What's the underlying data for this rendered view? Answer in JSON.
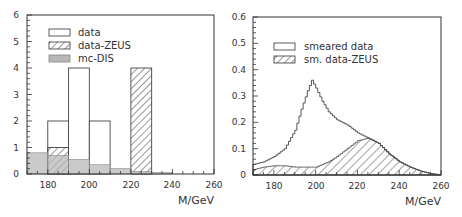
{
  "chart_data": [
    {
      "type": "bar",
      "subtype": "histogram",
      "title": "",
      "xlabel": "M/GeV",
      "ylabel": "",
      "xlim": [
        170,
        260
      ],
      "ylim": [
        0,
        6
      ],
      "xticks": [
        180,
        200,
        220,
        240,
        260
      ],
      "yticks": [
        0,
        1,
        2,
        3,
        4,
        5,
        6
      ],
      "grid": false,
      "legend_position": "upper-left",
      "bin_edges": [
        170,
        180,
        190,
        200,
        210,
        220,
        230,
        240,
        250,
        260
      ],
      "series": [
        {
          "name": "data",
          "style": "outline",
          "values": [
            0,
            2,
            4,
            2,
            0,
            0,
            0,
            0,
            0
          ]
        },
        {
          "name": "data-ZEUS",
          "style": "hatched",
          "values": [
            0,
            1,
            0,
            0,
            0,
            4,
            0,
            0,
            0
          ]
        },
        {
          "name": "mc-DIS",
          "style": "gray-filled",
          "values": [
            0.8,
            0.7,
            0.55,
            0.35,
            0.2,
            0.1,
            0.05,
            0,
            0
          ]
        }
      ]
    },
    {
      "type": "area",
      "subtype": "step-histogram",
      "title": "",
      "xlabel": "M/GeV",
      "ylabel": "",
      "xlim": [
        170,
        260
      ],
      "ylim": [
        0,
        0.6
      ],
      "xticks": [
        180,
        200,
        220,
        240,
        260
      ],
      "yticks": [
        0,
        0.1,
        0.2,
        0.3,
        0.4,
        0.5,
        0.6
      ],
      "grid": false,
      "legend_position": "upper-left",
      "x": [
        170,
        175,
        180,
        185,
        190,
        193,
        196,
        198,
        200,
        203,
        206,
        210,
        215,
        220,
        225,
        230,
        235,
        240,
        245,
        250,
        255,
        260
      ],
      "series": [
        {
          "name": "smeared data",
          "style": "outline",
          "values": [
            0.04,
            0.05,
            0.07,
            0.1,
            0.17,
            0.25,
            0.32,
            0.36,
            0.33,
            0.28,
            0.24,
            0.21,
            0.19,
            0.16,
            0.14,
            0.12,
            0.08,
            0.05,
            0.03,
            0.015,
            0.005,
            0.0
          ]
        },
        {
          "name": "sm. data-ZEUS",
          "style": "hatched",
          "values": [
            0.02,
            0.03,
            0.035,
            0.035,
            0.03,
            0.03,
            0.03,
            0.03,
            0.03,
            0.04,
            0.05,
            0.07,
            0.1,
            0.13,
            0.14,
            0.12,
            0.08,
            0.05,
            0.03,
            0.015,
            0.005,
            0.0
          ]
        }
      ]
    }
  ],
  "left_panel": {
    "xlabel": "M/GeV",
    "xtick_labels": [
      "180",
      "200",
      "220",
      "240",
      "260"
    ],
    "ytick_labels": [
      "0",
      "1",
      "2",
      "3",
      "4",
      "5",
      "6"
    ],
    "legend": [
      {
        "label": "data"
      },
      {
        "label": "data-ZEUS"
      },
      {
        "label": "mc-DIS"
      }
    ]
  },
  "right_panel": {
    "xlabel": "M/GeV",
    "xtick_labels": [
      "180",
      "200",
      "220",
      "240",
      "260"
    ],
    "ytick_labels": [
      "0",
      "0.1",
      "0.2",
      "0.3",
      "0.4",
      "0.5",
      "0.6"
    ],
    "legend": [
      {
        "label": "smeared data"
      },
      {
        "label": "sm. data-ZEUS"
      }
    ]
  },
  "colors": {
    "axis": "#333333",
    "line": "#444444",
    "gray_fill": "#b8b8b8",
    "hatch": "#333333"
  }
}
